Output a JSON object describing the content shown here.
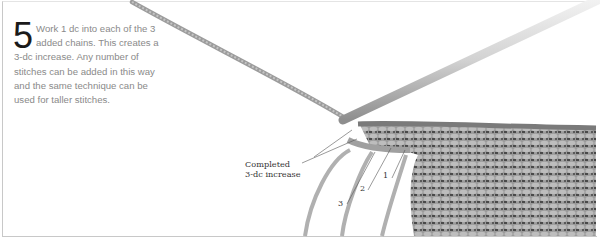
{
  "step": {
    "number": "5",
    "text": "Work 1 dc into each of the 3 added chains. This creates a 3-dc increase. Any number of stitches can be added in this way and the same technique can be used for taller stitches."
  },
  "illustration": {
    "callout_line1": "Completed",
    "callout_line2": "3-dc increase",
    "stitch_labels": [
      "1",
      "2",
      "3"
    ],
    "colors": {
      "yarn": "#b8b8b8",
      "fabric": "#8c8c8c",
      "hook": "#d8d8d8",
      "border": "#c8c8c8",
      "text": "#8a8a8a"
    }
  }
}
